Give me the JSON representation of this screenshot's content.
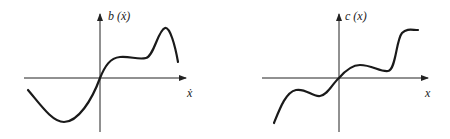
{
  "panels": [
    {
      "id": "left",
      "y_label": "b (ẋ)",
      "x_label": "ẋ",
      "curve_description": "odd-like function passing through origin: dips to minimum on negative side, plateau then sharp peak on positive side, falling off at right end"
    },
    {
      "id": "right",
      "y_label": "c (x)",
      "x_label": "x",
      "curve_description": "monotone-ish wavy function through origin with local wiggles on both sides, rising steeply to a plateau at right"
    }
  ],
  "colors": {
    "ink": "#1a1a1a",
    "background": "#ffffff"
  }
}
